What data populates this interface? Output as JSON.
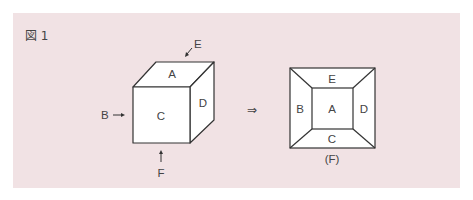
{
  "figure": {
    "title": "図 1",
    "cube": {
      "faces": {
        "top": "A",
        "front": "C",
        "right": "D"
      },
      "pointers": {
        "left": "B",
        "back": "E",
        "bottom": "F"
      }
    },
    "implies_symbol": "⇒",
    "view": {
      "center": "A",
      "top": "E",
      "left": "B",
      "right": "D",
      "bottom": "C",
      "caption": "(F)"
    }
  }
}
